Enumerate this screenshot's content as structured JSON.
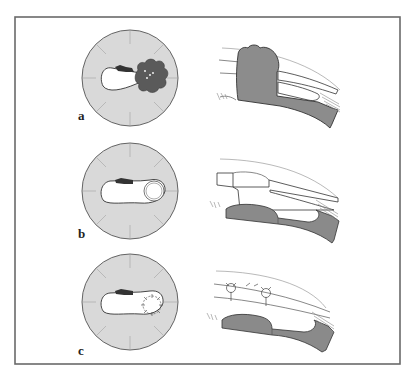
{
  "figure": {
    "panels": [
      {
        "label": "a",
        "description": "Cross-section with dark lobulated mass obstructing lumen; longitudinal view shows mass plug through wall"
      },
      {
        "label": "b",
        "description": "Cross-section after excision showing circular defect; longitudinal view shows stepped excised wall"
      },
      {
        "label": "c",
        "description": "Cross-section with sutured closure; longitudinal view shows sutures on wall"
      }
    ],
    "colors": {
      "frame": "#6a6a6a",
      "disc_fill": "#d9d9d9",
      "mass_fill": "#5a5a5a",
      "wall_fill": "#8a8a8a",
      "dark_lesion": "#333333"
    }
  }
}
